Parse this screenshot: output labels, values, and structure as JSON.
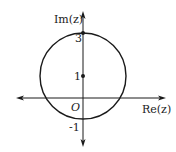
{
  "diagram": {
    "type": "complex-plane-circle",
    "axes": {
      "imaginary_label": "Im(z)",
      "real_label": "Re(z)",
      "origin_label": "O"
    },
    "ticks": {
      "top": "3",
      "center": "1",
      "bottom": "-1"
    },
    "circle": {
      "center": [
        0,
        1
      ],
      "radius": 2
    },
    "points": [
      {
        "label": "3",
        "value": [
          0,
          3
        ]
      },
      {
        "label": "1",
        "value": [
          0,
          1
        ]
      }
    ],
    "colors": {
      "stroke": "#1a1a1a",
      "text": "#222222",
      "background": "#ffffff"
    }
  }
}
